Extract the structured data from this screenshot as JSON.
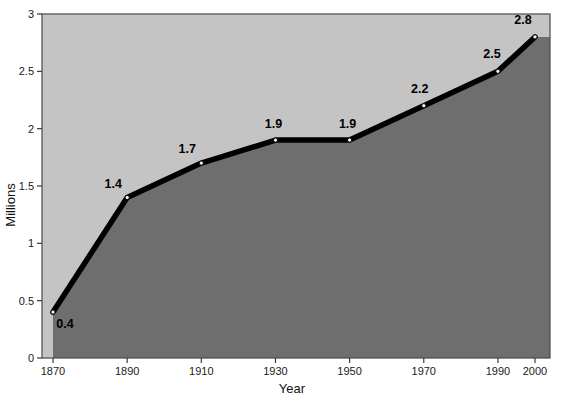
{
  "chart_data": {
    "type": "area",
    "title": "",
    "subtitle": "",
    "xlabel": "Year",
    "ylabel": "Millions",
    "x": [
      1870,
      1890,
      1910,
      1930,
      1950,
      1970,
      1990,
      2000
    ],
    "categories": [
      "1870",
      "1890",
      "1910",
      "1930",
      "1950",
      "1970",
      "1990",
      "2000"
    ],
    "values": [
      0.4,
      1.4,
      1.7,
      1.9,
      1.9,
      2.2,
      2.5,
      2.8
    ],
    "point_labels": [
      "0.4",
      "1.4",
      "1.7",
      "1.9",
      "1.9",
      "2.2",
      "2.5",
      "2.8"
    ],
    "xticks": [
      "1870",
      "1890",
      "1910",
      "1930",
      "1950",
      "1970",
      "1990",
      "2000"
    ],
    "yticks": [
      "0",
      "0.5",
      "1",
      "1.5",
      "2",
      "2.5",
      "3"
    ],
    "ytick_values": [
      0,
      0.5,
      1,
      1.5,
      2,
      2.5,
      3
    ],
    "ylim": [
      0,
      3
    ],
    "xlim": [
      1870,
      2000
    ],
    "grid": false,
    "legend": "none",
    "colors": {
      "plot_background": "#c4c4c4",
      "area_fill": "#6e6e6e",
      "line": "#000000",
      "marker_fill": "#f2f2f2",
      "marker_stroke": "#000000",
      "axis": "#3a3a3a",
      "page_background": "#ffffff",
      "label_text": "#000000"
    }
  },
  "axes": {
    "y_title": "Millions",
    "x_title": "Year"
  },
  "y_tick_items": [
    {
      "label": "3",
      "value": 3
    },
    {
      "label": "2.5",
      "value": 2.5
    },
    {
      "label": "2",
      "value": 2
    },
    {
      "label": "1.5",
      "value": 1.5
    },
    {
      "label": "1",
      "value": 1
    },
    {
      "label": "0.5",
      "value": 0.5
    },
    {
      "label": "0",
      "value": 0
    }
  ],
  "x_tick_items": [
    {
      "label": "1870"
    },
    {
      "label": "1890"
    },
    {
      "label": "1910"
    },
    {
      "label": "1930"
    },
    {
      "label": "1950"
    },
    {
      "label": "1970"
    },
    {
      "label": "1990"
    },
    {
      "label": "2000"
    }
  ],
  "series_points": [
    {
      "label": "0.4",
      "year": "1870"
    },
    {
      "label": "1.4",
      "year": "1890"
    },
    {
      "label": "1.7",
      "year": "1910"
    },
    {
      "label": "1.9",
      "year": "1930"
    },
    {
      "label": "1.9",
      "year": "1950"
    },
    {
      "label": "2.2",
      "year": "1970"
    },
    {
      "label": "2.5",
      "year": "1990"
    },
    {
      "label": "2.8",
      "year": "2000"
    }
  ]
}
